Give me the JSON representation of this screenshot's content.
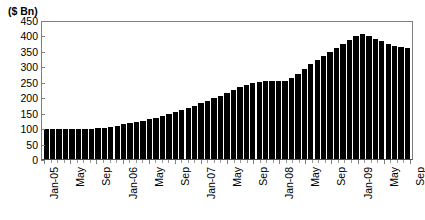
{
  "chart_data": {
    "type": "bar",
    "title": "",
    "subtitle": "",
    "xlabel": "",
    "ylabel": "($ Bn)",
    "ylim": [
      0,
      450
    ],
    "ytick_values": [
      0,
      50,
      100,
      150,
      200,
      250,
      300,
      350,
      400,
      450
    ],
    "ytick_labels": [
      "0",
      "50",
      "100",
      "150",
      "200",
      "250",
      "300",
      "350",
      "400",
      "450"
    ],
    "grid": false,
    "legend": null,
    "legend_position": "none",
    "bar_color": "#000000",
    "categories": [
      "Jan-05",
      "Feb-05",
      "Mar-05",
      "Apr-05",
      "May-05",
      "Jun-05",
      "Jul-05",
      "Aug-05",
      "Sep-05",
      "Oct-05",
      "Nov-05",
      "Dec-05",
      "Jan-06",
      "Feb-06",
      "Mar-06",
      "Apr-06",
      "May-06",
      "Jun-06",
      "Jul-06",
      "Aug-06",
      "Sep-06",
      "Oct-06",
      "Nov-06",
      "Dec-06",
      "Jan-07",
      "Feb-07",
      "Mar-07",
      "Apr-07",
      "May-07",
      "Jun-07",
      "Jul-07",
      "Aug-07",
      "Sep-07",
      "Oct-07",
      "Nov-07",
      "Dec-07",
      "Jan-08",
      "Feb-08",
      "Mar-08",
      "Apr-08",
      "May-08",
      "Jun-08",
      "Jul-08",
      "Aug-08",
      "Sep-08",
      "Oct-08",
      "Nov-08",
      "Dec-08",
      "Jan-09",
      "Feb-09",
      "Mar-09",
      "Apr-09",
      "May-09",
      "Jun-09",
      "Jul-09",
      "Aug-09",
      "Sep-09"
    ],
    "values": [
      96,
      96,
      96,
      96,
      96,
      97,
      97,
      98,
      99,
      101,
      104,
      108,
      112,
      116,
      120,
      124,
      129,
      134,
      140,
      146,
      152,
      158,
      165,
      172,
      180,
      188,
      196,
      205,
      215,
      224,
      232,
      240,
      246,
      250,
      252,
      252,
      252,
      254,
      262,
      275,
      292,
      308,
      322,
      335,
      348,
      360,
      372,
      384,
      397,
      405,
      398,
      390,
      382,
      372,
      365,
      362,
      360
    ],
    "xtick_labels": [
      "Jan-05",
      "May",
      "Sep",
      "Jan-06",
      "May",
      "Sep",
      "Jan-07",
      "May",
      "Sep",
      "Jan-08",
      "May",
      "Sep",
      "Jan-09",
      "May",
      "Sep"
    ],
    "xtick_indices": [
      0,
      4,
      8,
      12,
      16,
      20,
      24,
      28,
      32,
      36,
      40,
      44,
      48,
      52,
      56
    ]
  }
}
